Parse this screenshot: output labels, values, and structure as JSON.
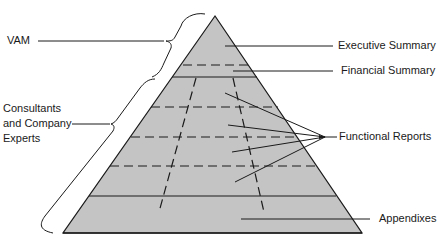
{
  "diagram": {
    "type": "pyramid",
    "fill_color": "#c4c4c4",
    "line_color": "#1a1a1a",
    "left_labels": {
      "vam": "VAM",
      "consultants_line1": "Consultants",
      "consultants_line2": "and Company",
      "consultants_line3": "Experts"
    },
    "right_labels": {
      "executive_summary": "Executive Summary",
      "financial_summary": "Financial Summary",
      "functional_reports": "Functional Reports",
      "appendixes": "Appendixes"
    }
  }
}
